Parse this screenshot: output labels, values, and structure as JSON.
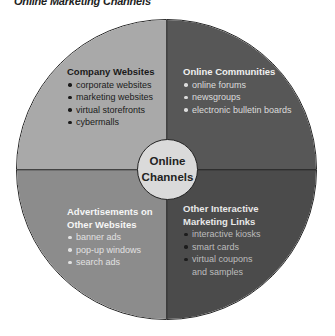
{
  "title": "Online Marketing Channels",
  "center": {
    "line1": "Online",
    "line2": "Channels"
  },
  "colors": {
    "top_left": "#a9a9a9",
    "top_right": "#575757",
    "bottom_left": "#8c8c8c",
    "bottom_right": "#4b4b4b",
    "center": "#dadada",
    "outline": "#222222"
  },
  "quadrants": {
    "top_left": {
      "heading": "Company Websites",
      "items": [
        "corporate websites",
        "marketing websites",
        "virtual storefronts",
        "cybermalls"
      ]
    },
    "top_right": {
      "heading": "Online Communities",
      "items": [
        "online forums",
        "newsgroups",
        "electronic bulletin boards"
      ]
    },
    "bottom_left": {
      "heading_line1": "Advertisements on",
      "heading_line2": "Other Websites",
      "items": [
        "banner ads",
        "pop-up windows",
        "search ads"
      ]
    },
    "bottom_right": {
      "heading_line1": "Other Interactive",
      "heading_line2": "Marketing Links",
      "items": [
        "interactive kiosks",
        "smart cards",
        "virtual coupons"
      ],
      "item3_cont": "and samples"
    }
  }
}
